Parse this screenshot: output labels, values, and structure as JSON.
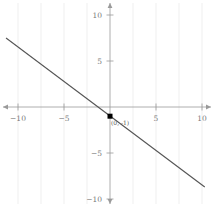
{
  "chart_data": {
    "type": "line",
    "title": "",
    "subtitle": "",
    "xlabel": "",
    "ylabel": "",
    "xlim": [
      -11.3,
      11.3
    ],
    "ylim": [
      -11.3,
      11.3
    ],
    "grid": true,
    "grid_axis": "x",
    "legend": "none",
    "series": [
      {
        "name": "line",
        "type": "line",
        "slope": -0.75,
        "intercept": -1,
        "equation": "y = -0.75x - 1",
        "color": "#555555",
        "x": [
          -11.3,
          10.3
        ],
        "y": [
          7.5,
          -8.7
        ]
      }
    ],
    "points": [
      {
        "name": "y-intercept",
        "x": 0,
        "y": -1,
        "label": "(0, -1)",
        "marker": "square",
        "color": "#000000"
      }
    ],
    "x_ticks": [
      -10,
      -5,
      5,
      10
    ],
    "x_tick_labels": [
      "−10",
      "−5",
      "5",
      "10"
    ],
    "y_ticks": [
      10,
      5,
      -5,
      -10
    ],
    "y_tick_labels": [
      "10",
      "5",
      "−5",
      "−10"
    ],
    "gridlines_x": [
      -10,
      -7.5,
      -5,
      -2.5,
      2.5,
      5,
      7.5,
      10
    ],
    "axis_color": "#9a9a9a",
    "grid_color": "#e8e8e8",
    "tick_label_color": "#7a7a7a",
    "background": "#ffffff"
  },
  "axes": {
    "x_axis_name": "x-axis",
    "y_axis_name": "y-axis",
    "origin_label": "",
    "arrowheads": [
      "left",
      "right",
      "up",
      "down"
    ]
  },
  "ticks": {
    "x": [
      {
        "value": -10,
        "label": "−10"
      },
      {
        "value": -5,
        "label": "−5"
      },
      {
        "value": 5,
        "label": "5"
      },
      {
        "value": 10,
        "label": "10"
      }
    ],
    "y": [
      {
        "value": 10,
        "label": "10"
      },
      {
        "value": 5,
        "label": "5"
      },
      {
        "value": -5,
        "label": "−5"
      },
      {
        "value": -10,
        "label": "−10"
      }
    ]
  },
  "annotations": {
    "point_label": "(0, -1)"
  }
}
